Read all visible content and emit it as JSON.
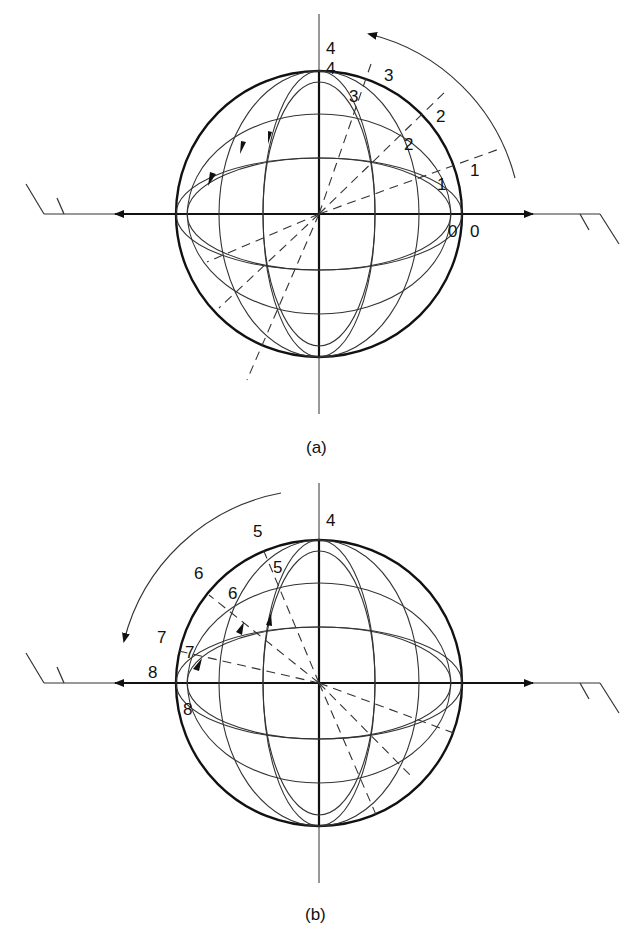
{
  "figure": {
    "panels": [
      {
        "id": "a",
        "caption": "(a)",
        "rotation_direction": "counterclockwise",
        "outer_labels": [
          "0",
          "1",
          "2",
          "3",
          "4"
        ],
        "inner_labels": [
          "0",
          "1",
          "2",
          "3",
          "4"
        ],
        "latitude_ellipses": 3,
        "longitude_ellipses": 2
      },
      {
        "id": "b",
        "caption": "(b)",
        "rotation_direction": "counterclockwise",
        "outer_labels": [
          "4",
          "5",
          "6",
          "7",
          "8"
        ],
        "inner_labels": [
          "5",
          "6",
          "7",
          "8"
        ],
        "latitude_ellipses": 3,
        "longitude_ellipses": 2
      }
    ],
    "colors": {
      "line": "#111111",
      "thin_line": "#333333",
      "background": "#ffffff"
    }
  }
}
